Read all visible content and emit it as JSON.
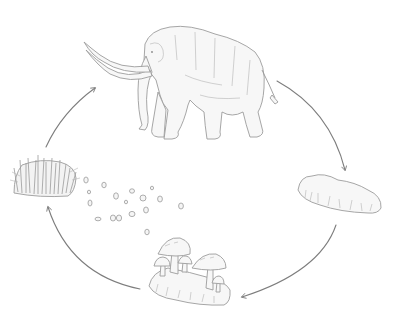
{
  "diagram": {
    "type": "cycle",
    "stages": [
      {
        "id": "mammoth",
        "icon": "mammoth-icon"
      },
      {
        "id": "dung",
        "icon": "dung-icon"
      },
      {
        "id": "fungi",
        "icon": "mushrooms-icon"
      },
      {
        "id": "grass",
        "icon": "grass-tuft-icon"
      }
    ],
    "flows": [
      {
        "from": "mammoth",
        "to": "dung"
      },
      {
        "from": "dung",
        "to": "fungi"
      },
      {
        "from": "fungi",
        "to": "grass"
      },
      {
        "from": "grass",
        "to": "mammoth"
      }
    ],
    "extras": [
      {
        "id": "seeds",
        "icon": "seeds-icon",
        "count": 17
      }
    ],
    "colors": {
      "line": "#8a8a8a",
      "fill": "#f7f7f7",
      "background": "#ffffff"
    }
  }
}
